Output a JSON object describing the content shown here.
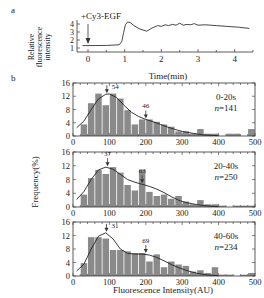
{
  "figure": {
    "panel_a_label": "a",
    "panel_b_label": "b",
    "shared_ylabel_b": "Frequency(%)",
    "shared_xlabel_b": "Fluorescence Intensity(AU)"
  },
  "chart_data": [
    {
      "panel": "a",
      "type": "line",
      "title": "",
      "xlabel": "Time(min)",
      "ylabel": "Relative fluorescence intensity",
      "xlim": [
        -0.3,
        4.5
      ],
      "ylim": [
        0.5,
        4.5
      ],
      "xticks": [
        0,
        1,
        2,
        3,
        4
      ],
      "yticks": [
        1,
        2,
        3,
        4
      ],
      "annotation": "+Cy3-EGF",
      "annotation_x": 0,
      "x": [
        -0.15,
        0.0,
        0.5,
        0.85,
        0.92,
        0.97,
        1.02,
        1.08,
        1.15,
        1.25,
        1.4,
        1.6,
        1.75,
        1.9,
        2.0,
        2.1,
        2.2,
        2.3,
        2.4,
        2.5,
        2.6,
        2.7,
        2.8,
        2.9,
        3.0,
        3.2,
        3.5,
        3.8,
        4.1,
        4.4
      ],
      "y": [
        1.3,
        1.3,
        1.32,
        1.4,
        1.8,
        2.9,
        3.9,
        4.25,
        4.2,
        3.8,
        3.4,
        3.1,
        3.5,
        3.8,
        3.7,
        3.9,
        3.8,
        3.95,
        3.85,
        4.1,
        3.85,
        3.95,
        3.9,
        4.05,
        3.85,
        3.9,
        3.8,
        3.7,
        3.6,
        3.45
      ]
    },
    {
      "panel": "b1",
      "type": "bar",
      "label": "0-20s",
      "n_label": "n=141",
      "xlabel": "",
      "ylabel": "Frequency(%)",
      "xlim": [
        0,
        500
      ],
      "ylim": [
        0,
        16
      ],
      "xticks": [
        0,
        100,
        200,
        300,
        400,
        500
      ],
      "yticks": [
        0,
        4,
        8,
        12,
        16
      ],
      "bin_width": 20,
      "bin_starts": [
        20,
        40,
        60,
        80,
        100,
        120,
        140,
        160,
        180,
        200,
        220,
        240,
        260,
        280,
        300,
        320,
        340,
        360,
        380,
        400,
        420,
        440,
        460,
        480
      ],
      "values": [
        3.5,
        9.9,
        12.8,
        9.3,
        12.8,
        11.3,
        7.8,
        3.5,
        5.0,
        5.0,
        4.3,
        3.5,
        2.8,
        1.4,
        1.4,
        0.7,
        2.1,
        0.7,
        0.7,
        0.0,
        0.7,
        0.7,
        0.0,
        2.1
      ],
      "fit_peaks": [
        {
          "x": 93,
          "label": "54"
        },
        {
          "x": 200,
          "label": "46"
        }
      ],
      "fit_x": [
        10,
        30,
        50,
        70,
        90,
        100,
        120,
        140,
        160,
        180,
        200,
        220,
        240,
        260,
        280,
        300,
        330,
        360,
        400
      ],
      "fit_y": [
        2.5,
        4.5,
        8.0,
        11.2,
        12.6,
        12.7,
        11.6,
        9.3,
        7.2,
        5.9,
        5.0,
        4.3,
        3.5,
        2.7,
        2.0,
        1.4,
        0.8,
        0.3,
        0.1
      ]
    },
    {
      "panel": "b2",
      "type": "bar",
      "label": "20-40s",
      "n_label": "n=250",
      "xlabel": "",
      "ylabel": "Frequency(%)",
      "xlim": [
        0,
        500
      ],
      "ylim": [
        0,
        16
      ],
      "xticks": [
        0,
        100,
        200,
        300,
        400,
        500
      ],
      "yticks": [
        0,
        4,
        8,
        12,
        16
      ],
      "bin_width": 20,
      "bin_starts": [
        20,
        40,
        60,
        80,
        100,
        120,
        140,
        160,
        180,
        200,
        220,
        240,
        260,
        280,
        300,
        320,
        340,
        360,
        380,
        400,
        420,
        440,
        460,
        480
      ],
      "values": [
        3.6,
        8.4,
        10.8,
        9.6,
        11.6,
        10.0,
        6.4,
        4.8,
        10.8,
        4.4,
        3.2,
        3.6,
        2.4,
        3.2,
        1.6,
        0.8,
        2.0,
        0.8,
        0.8,
        0.4,
        0.0,
        0.4,
        0.4,
        0.4
      ],
      "fit_peaks": [
        {
          "x": 95,
          "label": "37"
        },
        {
          "x": 190,
          "label": "63"
        }
      ],
      "fit_x": [
        10,
        30,
        50,
        70,
        90,
        110,
        130,
        150,
        170,
        190,
        210,
        230,
        250,
        270,
        290,
        310,
        340,
        370,
        400
      ],
      "fit_y": [
        2.2,
        4.5,
        8.0,
        10.8,
        11.6,
        11.0,
        9.5,
        8.0,
        7.2,
        6.6,
        6.0,
        5.2,
        4.2,
        3.0,
        2.0,
        1.3,
        0.7,
        0.3,
        0.1
      ]
    },
    {
      "panel": "b3",
      "type": "bar",
      "label": "40-60s",
      "n_label": "n=234",
      "xlabel": "Fluorescence Intensity(AU)",
      "ylabel": "Frequency(%)",
      "xlim": [
        0,
        500
      ],
      "ylim": [
        0,
        16
      ],
      "xticks": [
        0,
        100,
        200,
        300,
        400,
        500
      ],
      "yticks": [
        0,
        4,
        8,
        12,
        16
      ],
      "bin_width": 20,
      "bin_starts": [
        20,
        40,
        60,
        80,
        100,
        120,
        140,
        160,
        180,
        200,
        220,
        240,
        260,
        280,
        300,
        320,
        340,
        360,
        380,
        400,
        420,
        440,
        460,
        480
      ],
      "values": [
        3.8,
        11.5,
        11.5,
        11.1,
        7.7,
        7.7,
        7.3,
        6.8,
        6.8,
        4.3,
        6.4,
        2.6,
        4.3,
        3.4,
        3.0,
        1.3,
        1.7,
        0.9,
        2.6,
        0.4,
        0.4,
        0.0,
        0.4,
        0.9
      ],
      "fit_peaks": [
        {
          "x": 92,
          "label": "31"
        },
        {
          "x": 200,
          "label": "69"
        }
      ],
      "fit_x": [
        10,
        30,
        50,
        70,
        90,
        110,
        130,
        150,
        170,
        190,
        210,
        230,
        250,
        270,
        290,
        310,
        340,
        370,
        400
      ],
      "fit_y": [
        1.5,
        3.5,
        8.0,
        11.8,
        12.8,
        11.0,
        8.0,
        6.7,
        6.5,
        6.5,
        6.2,
        5.5,
        4.5,
        3.4,
        2.5,
        1.7,
        0.8,
        0.3,
        0.1
      ]
    }
  ]
}
